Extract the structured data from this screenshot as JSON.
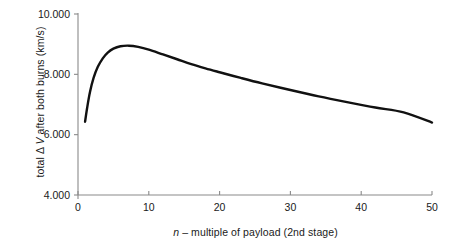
{
  "chart_data": {
    "type": "line",
    "title": "",
    "xlabel_parts": {
      "italic": "n",
      "rest": " – multiple of payload (2nd stage)"
    },
    "xlabel": "n – multiple of payload (2nd stage)",
    "ylabel_parts": {
      "pre": "total Δ ",
      "italic": "V",
      "post": " after both burns (km/s)"
    },
    "ylabel": "total Δ V after both burns (km/s)",
    "xlim": [
      0,
      50
    ],
    "ylim": [
      4000,
      10000
    ],
    "grid": false,
    "legend": "none",
    "xticks": [
      {
        "value": 0,
        "label": "0"
      },
      {
        "value": 10,
        "label": "10"
      },
      {
        "value": 20,
        "label": "20"
      },
      {
        "value": 30,
        "label": "30"
      },
      {
        "value": 40,
        "label": "40"
      },
      {
        "value": 50,
        "label": "50"
      }
    ],
    "yticks": [
      {
        "value": 4000,
        "label": "4.000"
      },
      {
        "value": 6000,
        "label": "6.000"
      },
      {
        "value": 8000,
        "label": "8.000"
      },
      {
        "value": 10000,
        "label": "10.000"
      }
    ],
    "series": [
      {
        "name": "total delta-V after both burns",
        "color": "#111111",
        "linewidth": 2.4,
        "x": [
          1,
          1.3,
          1.7,
          2.2,
          2.8,
          3.5,
          4.2,
          5,
          6,
          7.2,
          8.5,
          10,
          12,
          14,
          16,
          18,
          20,
          23,
          26,
          30,
          34,
          38,
          42,
          46,
          50
        ],
        "y": [
          6430,
          6900,
          7420,
          7880,
          8250,
          8530,
          8720,
          8850,
          8930,
          8950,
          8910,
          8820,
          8660,
          8500,
          8340,
          8200,
          8070,
          7880,
          7700,
          7480,
          7270,
          7080,
          6900,
          6740,
          6400
        ]
      }
    ],
    "annotations": {
      "peak_x": 7.2,
      "peak_y": 8950,
      "start_x": 1,
      "start_y": 6430,
      "end_x": 50,
      "end_y": 6400
    }
  },
  "axes_style": {
    "spine_color": "#8a8a8a",
    "tick_color": "#8a8a8a",
    "text_color": "#1a1a1a",
    "background": "#ffffff"
  }
}
